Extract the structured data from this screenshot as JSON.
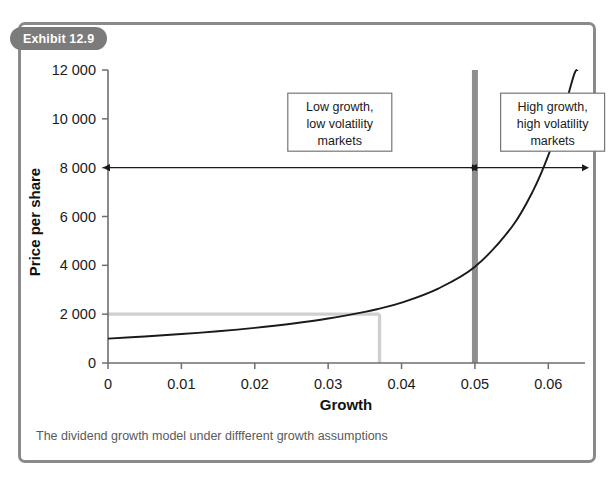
{
  "exhibit": {
    "badge_label": "Exhibit 12.9",
    "caption": "The dividend growth model under diffferent growth assumptions",
    "frame_color": "#8a8a8a",
    "badge_color": "#7b7b7b"
  },
  "chart_data": {
    "type": "line",
    "title": "",
    "xlabel": "Growth",
    "ylabel": "Price per share",
    "xlim": [
      0,
      0.065
    ],
    "ylim": [
      0,
      12000
    ],
    "grid": false,
    "legend": "none",
    "x_ticks": [
      0,
      0.01,
      0.02,
      0.03,
      0.04,
      0.05,
      0.06
    ],
    "x_tick_labels": [
      "0",
      "0.01",
      "0.02",
      "0.03",
      "0.04",
      "0.05",
      "0.06"
    ],
    "y_ticks": [
      0,
      2000,
      4000,
      6000,
      8000,
      10000,
      12000
    ],
    "y_tick_labels": [
      "0",
      "2 000",
      "4 000",
      "6 000",
      "8 000",
      "10 000",
      "12 000"
    ],
    "series": [
      {
        "name": "Dividend growth model price",
        "color": "#1a1a1a",
        "x": [
          0,
          0.005,
          0.01,
          0.015,
          0.02,
          0.025,
          0.03,
          0.035,
          0.037,
          0.04,
          0.045,
          0.05,
          0.055,
          0.058,
          0.06,
          0.062,
          0.0635,
          0.064
        ],
        "y": [
          1000,
          1085,
          1185,
          1300,
          1440,
          1610,
          1820,
          2095,
          2230,
          2470,
          3050,
          3940,
          5560,
          7100,
          8500,
          10250,
          11800,
          12000
        ]
      }
    ],
    "reference_lines": [
      {
        "name": "price-reference-horizontal",
        "orientation": "horizontal",
        "value": 2000,
        "from_x": 0,
        "to_x": 0.037,
        "color": "#cfcfcf"
      },
      {
        "name": "growth-reference-vertical",
        "orientation": "vertical",
        "value": 0.037,
        "from_y": 0,
        "to_y": 2000,
        "color": "#cfcfcf"
      }
    ],
    "markers": [
      {
        "name": "growth-threshold-bar",
        "orientation": "vertical",
        "value": 0.05,
        "from_y": 0,
        "to_y": 12000,
        "color": "#8e8e8e",
        "width": 6
      }
    ],
    "range_indicators": [
      {
        "name": "low-growth-range",
        "at_y": 8000,
        "from_x": 0,
        "to_x": 0.05,
        "double_headed": true
      },
      {
        "name": "high-growth-range",
        "at_y": 8000,
        "from_x": 0.05,
        "to_x": 0.065,
        "double_headed": true
      }
    ],
    "annotations": [
      {
        "name": "low-growth-annotation",
        "lines": [
          "Low growth,",
          "low volatility",
          "markets"
        ],
        "box_x": 0.0245,
        "box_y_top": 11050,
        "box_width_px": 104,
        "box_height_px": 58
      },
      {
        "name": "high-growth-annotation",
        "lines": [
          "High growth,",
          "high volatility",
          "markets"
        ],
        "box_x": 0.0535,
        "box_y_top": 11050,
        "box_width_px": 104,
        "box_height_px": 58
      }
    ]
  }
}
